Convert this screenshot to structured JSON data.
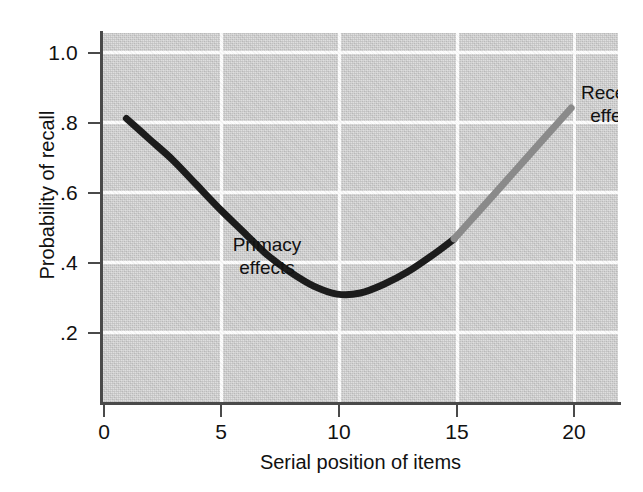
{
  "figure": {
    "background_color": "#ffffff",
    "panel_color": "#d2d2d2",
    "gridline_color": "#fcfcfc",
    "axis_color": "#4a4a4a"
  },
  "axes": {
    "x_title": "Serial position of items",
    "y_title": "Probability of recall",
    "x_ticklabels": [
      "0",
      "5",
      "10",
      "15",
      "20"
    ],
    "y_ticklabels": [
      "1.0",
      ".8",
      ".6",
      ".4",
      ".2"
    ]
  },
  "annotations": {
    "primacy": "Primacy\neffects",
    "recency": "Recency\neffects"
  },
  "chart_data": {
    "type": "line",
    "title": "",
    "subtitle": "",
    "xlabel": "Serial position of items",
    "ylabel": "Probability of recall",
    "xlim": [
      0,
      22
    ],
    "ylim": [
      0,
      1.06
    ],
    "xticks": [
      0,
      5,
      10,
      15,
      20
    ],
    "yticks": [
      1.0,
      0.8,
      0.6,
      0.4,
      0.2
    ],
    "xticklabels": [
      "0",
      "5",
      "10",
      "15",
      "20"
    ],
    "yticklabels": [
      "1.0",
      ".8",
      ".6",
      ".4",
      ".2"
    ],
    "grid": true,
    "grid_color": "#ffffff",
    "legend": false,
    "legend_position": "none",
    "series": [
      {
        "name": "Serial position curve (primacy segment)",
        "color": "#1c1c1c",
        "linewidth": 7,
        "x": [
          1,
          2,
          3,
          4,
          5,
          6,
          7,
          8,
          9,
          10,
          11,
          12,
          13,
          14,
          15
        ],
        "y": [
          0.815,
          0.755,
          0.695,
          0.625,
          0.555,
          0.49,
          0.425,
          0.375,
          0.335,
          0.312,
          0.315,
          0.34,
          0.375,
          0.42,
          0.47
        ]
      },
      {
        "name": "Serial position curve (recency segment)",
        "color": "#8a8a8a",
        "linewidth": 7,
        "x": [
          15,
          16,
          17,
          18,
          19,
          20
        ],
        "y": [
          0.47,
          0.545,
          0.62,
          0.695,
          0.77,
          0.845
        ]
      }
    ],
    "annotations": [
      {
        "text": "Primacy effects",
        "x": 1.4,
        "y": 0.52
      },
      {
        "text": "Recency effects",
        "x": 16.3,
        "y": 0.93
      }
    ]
  }
}
